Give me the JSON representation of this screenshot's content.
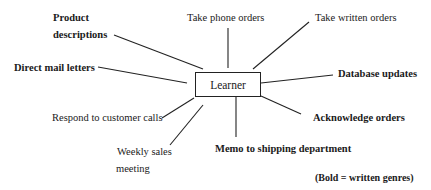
{
  "diagram": {
    "center": {
      "label": "Learner"
    },
    "nodes": [
      {
        "id": "product-descriptions",
        "lines": [
          "Product",
          "descriptions"
        ],
        "bold": true
      },
      {
        "id": "take-phone-orders",
        "lines": [
          "Take phone orders"
        ],
        "bold": false
      },
      {
        "id": "take-written-orders",
        "lines": [
          "Take written orders"
        ],
        "bold": false
      },
      {
        "id": "direct-mail-letters",
        "lines": [
          "Direct mail letters"
        ],
        "bold": true
      },
      {
        "id": "database-updates",
        "lines": [
          "Database updates"
        ],
        "bold": true
      },
      {
        "id": "respond-to-customer-calls",
        "lines": [
          "Respond to customer calls"
        ],
        "bold": false
      },
      {
        "id": "acknowledge-orders",
        "lines": [
          "Acknowledge orders"
        ],
        "bold": true
      },
      {
        "id": "weekly-sales-meeting",
        "lines": [
          "Weekly sales",
          "meeting"
        ],
        "bold": false
      },
      {
        "id": "memo-to-shipping-department",
        "lines": [
          "Memo to shipping department"
        ],
        "bold": true
      }
    ],
    "legend": "(Bold = written genres)",
    "line_color": "#222222"
  }
}
